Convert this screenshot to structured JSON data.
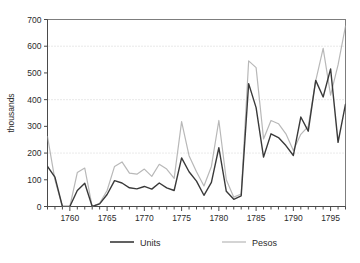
{
  "chart_data": {
    "type": "line",
    "title": "",
    "xlabel": "",
    "ylabel": "thousands",
    "xlim": [
      1757,
      1797
    ],
    "ylim": [
      0,
      700
    ],
    "grid": "horizontal-dotted",
    "gridlines": [
      200,
      400,
      600
    ],
    "ytick_labels": [
      "0",
      "100",
      "200",
      "300",
      "400",
      "500",
      "600",
      "700"
    ],
    "ytick_values": [
      0,
      100,
      200,
      300,
      400,
      500,
      600,
      700
    ],
    "xtick_labels": [
      "1760",
      "1765",
      "1770",
      "1775",
      "1780",
      "1785",
      "1790",
      "1795"
    ],
    "xtick_values": [
      1760,
      1765,
      1770,
      1775,
      1780,
      1785,
      1790,
      1795
    ],
    "xtick_minor_step": 1,
    "legend_position": "bottom",
    "x": [
      1757,
      1758,
      1759,
      1760,
      1761,
      1762,
      1763,
      1764,
      1765,
      1766,
      1767,
      1768,
      1769,
      1770,
      1771,
      1772,
      1773,
      1774,
      1775,
      1776,
      1777,
      1778,
      1779,
      1780,
      1781,
      1782,
      1783,
      1784,
      1785,
      1786,
      1787,
      1788,
      1789,
      1790,
      1791,
      1792,
      1793,
      1794,
      1795,
      1796,
      1797
    ],
    "series": [
      {
        "name": "Units",
        "color": "#3a3a3a",
        "width": 1.4,
        "values": [
          150,
          110,
          0,
          0,
          60,
          87,
          0,
          10,
          45,
          97,
          88,
          70,
          66,
          75,
          65,
          88,
          70,
          60,
          182,
          130,
          95,
          42,
          90,
          220,
          57,
          27,
          40,
          460,
          370,
          185,
          272,
          258,
          228,
          191,
          335,
          282,
          472,
          410,
          515,
          240,
          383
        ]
      },
      {
        "name": "Pesos",
        "color": "#b8b8b8",
        "width": 1.2,
        "values": [
          262,
          100,
          0,
          0,
          127,
          144,
          0,
          12,
          60,
          150,
          167,
          125,
          121,
          140,
          113,
          158,
          140,
          105,
          318,
          190,
          130,
          77,
          150,
          322,
          100,
          35,
          47,
          545,
          520,
          253,
          322,
          310,
          272,
          210,
          270,
          300,
          470,
          592,
          417,
          530,
          675
        ]
      }
    ]
  },
  "legend": {
    "items": [
      {
        "label": "Units",
        "color": "#3a3a3a"
      },
      {
        "label": "Pesos",
        "color": "#b8b8b8"
      }
    ]
  }
}
